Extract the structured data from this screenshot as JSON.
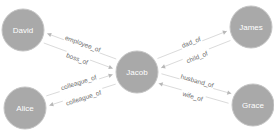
{
  "graph": {
    "nodes": [
      {
        "id": "David",
        "label": "David"
      },
      {
        "id": "James",
        "label": "James"
      },
      {
        "id": "Jacob",
        "label": "Jacob"
      },
      {
        "id": "Alice",
        "label": "Alice"
      },
      {
        "id": "Grace",
        "label": "Grace"
      }
    ],
    "edges": [
      {
        "source": "Jacob",
        "target": "David",
        "label": "employee_of"
      },
      {
        "source": "David",
        "target": "Jacob",
        "label": "boss_of"
      },
      {
        "source": "Jacob",
        "target": "James",
        "label": "dad_of"
      },
      {
        "source": "James",
        "target": "Jacob",
        "label": "child_of"
      },
      {
        "source": "Alice",
        "target": "Jacob",
        "label": "colleague_of"
      },
      {
        "source": "Jacob",
        "target": "Alice",
        "label": "colleague_of"
      },
      {
        "source": "Grace",
        "target": "Jacob",
        "label": "wife_of"
      },
      {
        "source": "Jacob",
        "target": "Grace",
        "label": "husband_of"
      }
    ],
    "colors": {
      "node_fill": "#a9a9a9",
      "node_label": "#ffffff",
      "edge": "#d0d0d0",
      "edge_label": "#6e6e6e"
    }
  }
}
